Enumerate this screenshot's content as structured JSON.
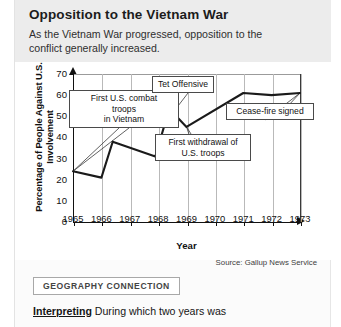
{
  "header": {
    "title": "Opposition to the Vietnam War",
    "subtitle": "As the Vietnam War progressed, opposition to the conflict generally increased."
  },
  "chart_data": {
    "type": "line",
    "title": "Opposition to the Vietnam War",
    "xlabel": "Year",
    "ylabel": "Percentage of People Against U.S. Involvement",
    "xlim": [
      1965,
      1973
    ],
    "ylim": [
      0,
      70
    ],
    "ytick_labels": [
      "0",
      "10",
      "20",
      "30",
      "40",
      "50",
      "60",
      "70"
    ],
    "yticks": [
      0,
      10,
      20,
      30,
      40,
      50,
      60,
      70
    ],
    "xtick_labels": [
      "1965",
      "1966",
      "1967",
      "1968",
      "1969",
      "1970",
      "1971",
      "1972",
      "1973"
    ],
    "xticks": [
      1965,
      1966,
      1967,
      1968,
      1969,
      1970,
      1971,
      1972,
      1973
    ],
    "grid": "vertical",
    "legend": "none",
    "line_color": "#1a1a1a",
    "x": [
      1965.0,
      1966.0,
      1966.4,
      1967.9,
      1968.25,
      1968.5,
      1969.0,
      1971.0,
      1972.0,
      1973.0
    ],
    "values": [
      24,
      21,
      38,
      31,
      47,
      52,
      45,
      61,
      60,
      61
    ],
    "source": "Source: Gallup News Service",
    "annotations": [
      {
        "label": "First U.S. combat troops in Vietnam",
        "lines": [
          "First U.S. combat",
          "troops",
          "in Vietnam"
        ],
        "points_to": 1965
      },
      {
        "label": "Tet Offensive",
        "lines": [
          "Tet Offensive"
        ],
        "points_to": 1968
      },
      {
        "label": "First withdrawal of U.S. troops",
        "lines": [
          "First withdrawal of",
          "U.S. troops"
        ],
        "points_to": 1969
      },
      {
        "label": "Cease-fire signed",
        "lines": [
          "Cease-fire signed"
        ],
        "points_to": 1973
      }
    ]
  },
  "footer": {
    "geography_connection": "GEOGRAPHY CONNECTION",
    "interpreting_lead": "Interpreting",
    "interpreting_text": "During which two years was"
  }
}
